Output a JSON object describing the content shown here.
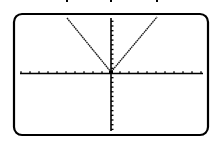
{
  "chart_data": {
    "type": "line",
    "title": "",
    "xlabel": "",
    "ylabel": "",
    "function": "y = a|x|",
    "vertex": [
      0,
      0
    ],
    "series": [
      {
        "name": "left-arm",
        "x": [
          -4.9,
          0
        ],
        "y": [
          11.5,
          0
        ]
      },
      {
        "name": "right-arm",
        "x": [
          0,
          5.1
        ],
        "y": [
          0,
          11.7
        ]
      }
    ],
    "xlim": [
      -10,
      10
    ],
    "ylim": [
      -13,
      12
    ],
    "x_ticks_per_side": 10,
    "y_ticks_above": 12,
    "y_ticks_below": 13,
    "grid": false,
    "legend": null
  },
  "colors": {
    "frame": "#000000",
    "axes": "#000000",
    "curve": "#1a1a1a",
    "background": "#ffffff"
  },
  "layout": {
    "frame": {
      "x": 14,
      "y": 14,
      "width": 194,
      "height": 121,
      "radius": 8
    },
    "origin": {
      "x": 111,
      "y": 73
    },
    "x_tick_spacing": 9,
    "y_tick_spacing": 4.7,
    "left_arm_top": {
      "x": 67,
      "y": 18
    },
    "right_arm_top": {
      "x": 157,
      "y": 17
    }
  }
}
